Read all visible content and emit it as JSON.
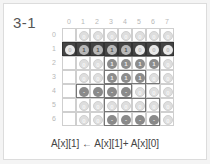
{
  "title": "3-1",
  "columns": [
    "0",
    "1",
    "2",
    "3",
    "4",
    "5",
    "6",
    "7"
  ],
  "rows": [
    "0",
    "1",
    "2",
    "3",
    "4",
    "5",
    "6"
  ],
  "highlight_row": 1,
  "grid": [
    [
      null,
      "0",
      "0",
      "0",
      "0",
      "0",
      "0",
      "0"
    ],
    [
      "0",
      "1",
      "1",
      "1",
      "1",
      "0",
      "0",
      "0"
    ],
    [
      null,
      "0",
      "0",
      "1",
      "1",
      "1",
      "1",
      "0"
    ],
    [
      null,
      "0",
      "0",
      "1",
      "1",
      "1",
      "0",
      "0"
    ],
    [
      null,
      "-1",
      "-1",
      "-1",
      "-1",
      "0",
      "0",
      "0"
    ],
    [
      null,
      "0",
      "0",
      "0",
      "0",
      "0",
      "0",
      "0"
    ],
    [
      null,
      "0",
      "0",
      "-1",
      "-1",
      "-1",
      "-1",
      "0"
    ]
  ],
  "formula": "A[x][1] ← A[x][1]+ A[x][0]",
  "colors": {
    "highlight_row": "#444444",
    "grid_line": "#cfcfcf",
    "dot_zero": "#dedede",
    "dot_value": "#8c8c8c"
  }
}
